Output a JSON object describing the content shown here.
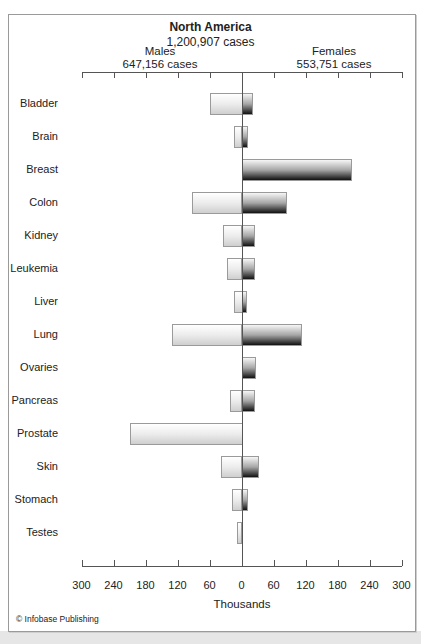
{
  "chart_data": {
    "type": "bar",
    "orientation": "horizontal-diverging",
    "title": "North America",
    "subtitle": "1,200,907 cases",
    "categories": [
      "Bladder",
      "Brain",
      "Breast",
      "Colon",
      "Kidney",
      "Leukemia",
      "Liver",
      "Lung",
      "Ovaries",
      "Pancreas",
      "Prostate",
      "Skin",
      "Stomach",
      "Testes"
    ],
    "series": [
      {
        "name": "Males",
        "subtitle": "647,156 cases",
        "side": "left",
        "color": "#d9d9d9",
        "values": [
          60,
          14,
          0,
          93,
          34,
          27,
          15,
          131,
          0,
          21,
          210,
          38,
          17,
          8
        ]
      },
      {
        "name": "Females",
        "subtitle": "553,751 cases",
        "side": "right",
        "color": "#333333",
        "values": [
          19,
          10,
          206,
          84,
          24,
          24,
          9,
          111,
          26,
          23,
          0,
          30,
          11,
          0
        ]
      }
    ],
    "xlabel": "Thousands",
    "ylabel": "",
    "xlim": [
      -300,
      300
    ],
    "tick_labels": [
      "300",
      "240",
      "180",
      "120",
      "60",
      "0",
      "60",
      "120",
      "180",
      "240",
      "300"
    ],
    "grid": false,
    "legend": "none (side labels above axis)"
  },
  "header": {
    "title": "North America",
    "total": "1,200,907 cases",
    "males_label": "Males",
    "males_total": "647,156 cases",
    "females_label": "Females",
    "females_total": "553,751 cases"
  },
  "axis": {
    "xlabel": "Thousands",
    "ticks": [
      "300",
      "240",
      "180",
      "120",
      "60",
      "0",
      "60",
      "120",
      "180",
      "240",
      "300"
    ]
  },
  "footer": {
    "copyright": "© Infobase Publishing"
  }
}
